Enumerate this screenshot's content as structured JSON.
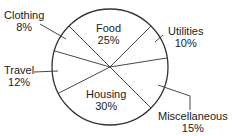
{
  "chart_data": {
    "type": "pie",
    "title": "",
    "categories": [
      "Food",
      "Utilities",
      "Miscellaneous",
      "Housing",
      "Travel",
      "Clothing"
    ],
    "values": [
      25,
      10,
      15,
      30,
      12,
      8
    ],
    "labels": [
      {
        "name": "Food",
        "pct": "25%"
      },
      {
        "name": "Utilities",
        "pct": "10%"
      },
      {
        "name": "Miscellaneous",
        "pct": "15%"
      },
      {
        "name": "Housing",
        "pct": "30%"
      },
      {
        "name": "Travel",
        "pct": "12%"
      },
      {
        "name": "Clothing",
        "pct": "8%"
      }
    ],
    "start_angle_deg": 315,
    "direction": "clockwise",
    "legend": "none",
    "colors": {
      "stroke": "#333333",
      "fill": "#ffffff"
    }
  }
}
